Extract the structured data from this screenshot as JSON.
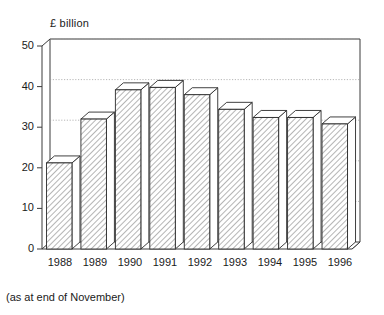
{
  "chart_data": {
    "type": "bar",
    "title": "£ billion",
    "subtitle": "",
    "xlabel": "",
    "ylabel": "£ billion",
    "footnote": "(as at end of November)",
    "categories": [
      "1988",
      "1989",
      "1990",
      "1991",
      "1992",
      "1993",
      "1994",
      "1995",
      "1996"
    ],
    "values": [
      21.2,
      32.0,
      39.2,
      39.8,
      38.0,
      34.4,
      32.4,
      32.4,
      30.8
    ],
    "ylim": [
      0,
      50
    ],
    "yticks": [
      0,
      10,
      20,
      30,
      40,
      50
    ],
    "ytick_labels": [
      "0",
      "10",
      "20",
      "30",
      "40",
      "50"
    ],
    "grid": true,
    "grid_axis": "y",
    "legend": false,
    "legend_position": "none",
    "style": "3d-hatched-bars",
    "bar_fill": "diagonal-hatch",
    "colors": {
      "background": "#ffffff",
      "bar_outline": "#2b2b2b",
      "bar_fill": "#ffffff",
      "hatch": "#555555",
      "frame": "#3a3a3a",
      "grid": "#9a9a9a",
      "text": "#1a1a1a"
    }
  },
  "axis": {
    "title": "£ billion",
    "y_labels": [
      "50",
      "40",
      "30",
      "20",
      "10",
      "0"
    ],
    "x_labels": [
      "1988",
      "1989",
      "1990",
      "1991",
      "1992",
      "1993",
      "1994",
      "1995",
      "1996"
    ]
  },
  "notes": {
    "footnote": "(as at end of November)"
  }
}
